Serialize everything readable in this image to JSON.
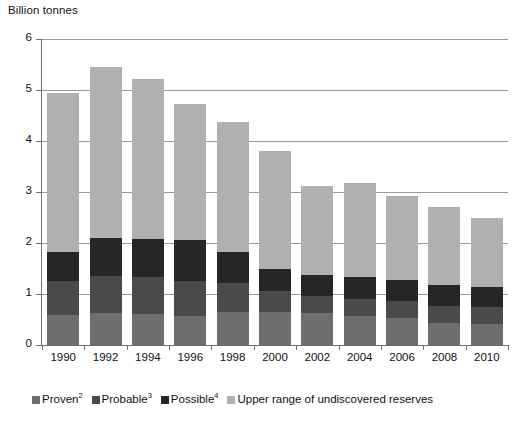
{
  "chart_data": {
    "type": "bar",
    "subtype": "stacked-bar",
    "title": "",
    "ylabel": "Billion tonnes",
    "xlabel": "",
    "ylim": [
      0,
      6
    ],
    "yticks": [
      0,
      1,
      2,
      3,
      4,
      5,
      6
    ],
    "ytick_labels": [
      "0",
      "1",
      "2",
      "3",
      "4",
      "5",
      "6"
    ],
    "grid": true,
    "legend_position": "bottom",
    "categories": [
      "1990",
      "1992",
      "1994",
      "1996",
      "1998",
      "2000",
      "2002",
      "2004",
      "2006",
      "2008",
      "2010"
    ],
    "series": [
      {
        "name": "Proven",
        "footnote": "2",
        "color": "#6e6e6e",
        "values": [
          0.58,
          0.63,
          0.6,
          0.56,
          0.65,
          0.64,
          0.62,
          0.56,
          0.52,
          0.44,
          0.42
        ]
      },
      {
        "name": "Probable",
        "footnote": "3",
        "color": "#4a4a4a",
        "values": [
          0.67,
          0.72,
          0.74,
          0.7,
          0.56,
          0.41,
          0.35,
          0.35,
          0.34,
          0.32,
          0.32
        ]
      },
      {
        "name": "Possible",
        "footnote": "4",
        "color": "#262626",
        "values": [
          0.58,
          0.74,
          0.74,
          0.79,
          0.61,
          0.45,
          0.4,
          0.42,
          0.42,
          0.42,
          0.39
        ]
      },
      {
        "name": "Upper range of undiscovered reserves",
        "footnote": "",
        "color": "#b0b0b0",
        "values": [
          3.12,
          3.37,
          3.14,
          2.68,
          2.55,
          2.3,
          1.75,
          1.84,
          1.64,
          1.53,
          1.37
        ]
      }
    ],
    "totals": [
      4.95,
      5.46,
      5.22,
      4.73,
      4.37,
      3.8,
      3.12,
      3.17,
      2.92,
      2.71,
      2.5
    ]
  },
  "legend": {
    "items": [
      {
        "label": "Proven",
        "sup": "2",
        "color": "#6e6e6e"
      },
      {
        "label": "Probable",
        "sup": "3",
        "color": "#4a4a4a"
      },
      {
        "label": "Possible",
        "sup": "4",
        "color": "#262626"
      },
      {
        "label": "Upper range of undiscovered reserves",
        "sup": "",
        "color": "#b0b0b0"
      }
    ]
  },
  "colors": {
    "axis": "#6f6f6f",
    "grid": "#9a9a9a",
    "text": "#111111",
    "background": "#ffffff"
  }
}
